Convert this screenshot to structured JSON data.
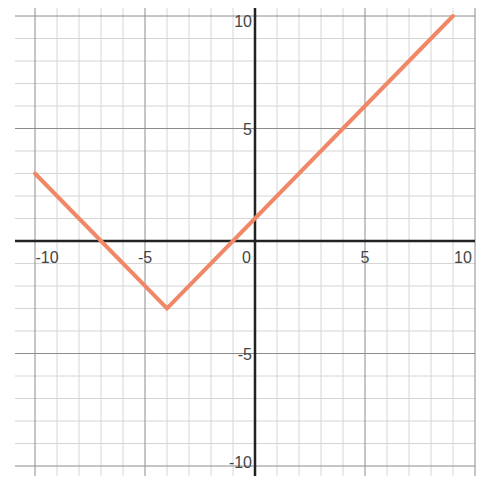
{
  "chart_data": {
    "type": "line",
    "title": "",
    "xlabel": "",
    "ylabel": "",
    "xlim": [
      -10,
      10
    ],
    "ylim": [
      -10,
      10
    ],
    "grid": true,
    "grid_minor_step": 1,
    "grid_major_step": 5,
    "legend": null,
    "x_ticks": [
      "-10",
      "-5",
      "0",
      "5",
      "10"
    ],
    "y_ticks": [
      "10",
      "5",
      "-5",
      "-10"
    ],
    "series": [
      {
        "name": "y = |x + 4| - 3",
        "color": "#f08868",
        "points": [
          [
            -10,
            3
          ],
          [
            -4,
            -3
          ],
          [
            9,
            10
          ]
        ]
      }
    ],
    "annotations": []
  },
  "layout": {
    "origin_px": [
      255,
      241
    ],
    "unit_px_x": 22,
    "unit_px_y": 22.5,
    "colors": {
      "minor_grid": "#d6d6d6",
      "major_grid": "#8c8c8c",
      "axis": "#222222",
      "line": "#f08868"
    }
  }
}
